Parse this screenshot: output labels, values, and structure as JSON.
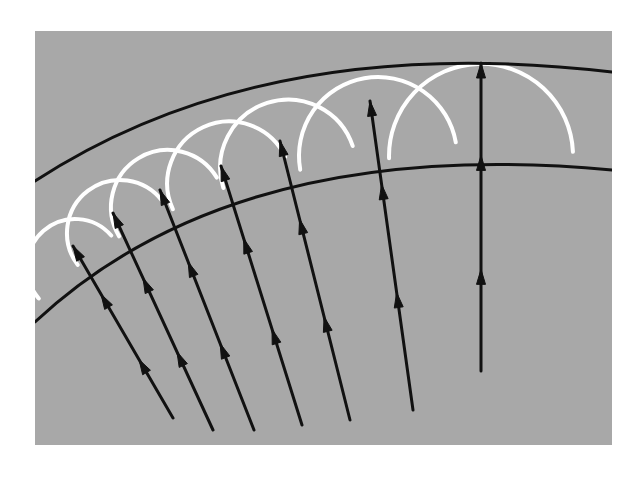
{
  "figure": {
    "kind": "physics-wavefront-diagram",
    "canvas": {
      "width": 639,
      "height": 479,
      "background": "#ffffff"
    },
    "panel": {
      "name": "gray-plate",
      "x": 35,
      "y": 31,
      "width": 577,
      "height": 414,
      "fill": "#a8a8a8"
    },
    "colors": {
      "panel_gray": "#a8a8a8",
      "wavefront_black": "#111111",
      "ray_black": "#111111",
      "wavelet_white": "#ffffff"
    },
    "strokes": {
      "wavefront_width": 3.0,
      "ray_width": 3.0,
      "wavelet_width": 4.0
    },
    "wavefronts": [
      {
        "name": "outer-wavefront",
        "label": "leading wavefront",
        "color": "#111111",
        "path": "M 35 181 Q 265 31 612 72",
        "apex": {
          "x": 490,
          "y": 63
        },
        "left_end": {
          "x": 35,
          "y": 181
        },
        "right_end": {
          "x": 612,
          "y": 72
        }
      },
      {
        "name": "inner-wavefront",
        "label": "previous wavefront",
        "color": "#111111",
        "path": "M 35 322 Q 235 135 612 170",
        "apex": {
          "x": 450,
          "y": 153
        },
        "left_end": {
          "x": 35,
          "y": 322
        },
        "right_end": {
          "x": 612,
          "y": 170
        }
      }
    ],
    "rays": [
      {
        "name": "ray-1",
        "x1": 173,
        "y1": 418,
        "x2": 73,
        "y2": 246,
        "heads": [
          0.34,
          0.72,
          1.0
        ]
      },
      {
        "name": "ray-2",
        "x1": 213,
        "y1": 430,
        "x2": 113,
        "y2": 213,
        "heads": [
          0.36,
          0.7,
          1.0
        ]
      },
      {
        "name": "ray-3",
        "x1": 254,
        "y1": 430,
        "x2": 160,
        "y2": 190,
        "heads": [
          0.36,
          0.7,
          1.0
        ]
      },
      {
        "name": "ray-4",
        "x1": 302,
        "y1": 425,
        "x2": 221,
        "y2": 166,
        "heads": [
          0.37,
          0.72,
          1.0
        ]
      },
      {
        "name": "ray-5",
        "x1": 350,
        "y1": 420,
        "x2": 280,
        "y2": 141,
        "heads": [
          0.37,
          0.72,
          1.0
        ]
      },
      {
        "name": "ray-6",
        "x1": 413,
        "y1": 410,
        "x2": 370,
        "y2": 101,
        "heads": [
          0.38,
          0.73,
          1.0
        ]
      },
      {
        "name": "ray-7",
        "x1": 481,
        "y1": 371,
        "x2": 481,
        "y2": 63,
        "heads": [
          0.33,
          0.7,
          1.0
        ]
      }
    ],
    "wavelets": [
      {
        "name": "wavelet-1",
        "cx": 75,
        "cy": 267,
        "r": 48,
        "rotation_deg": -41
      },
      {
        "name": "wavelet-2",
        "cx": 120,
        "cy": 233,
        "r": 53,
        "rotation_deg": -37
      },
      {
        "name": "wavelet-3",
        "cx": 168,
        "cy": 207,
        "r": 57,
        "rotation_deg": -31
      },
      {
        "name": "wavelet-4",
        "cx": 229,
        "cy": 183,
        "r": 62,
        "rotation_deg": -25
      },
      {
        "name": "wavelet-5",
        "cx": 288,
        "cy": 167,
        "r": 68,
        "rotation_deg": -18
      },
      {
        "name": "wavelet-6",
        "cx": 378,
        "cy": 156,
        "r": 79,
        "rotation_deg": -10
      },
      {
        "name": "wavelet-7",
        "cx": 481,
        "cy": 155,
        "r": 92,
        "rotation_deg": -2
      }
    ],
    "arrowhead": {
      "length": 15,
      "half_width": 4.5
    }
  }
}
